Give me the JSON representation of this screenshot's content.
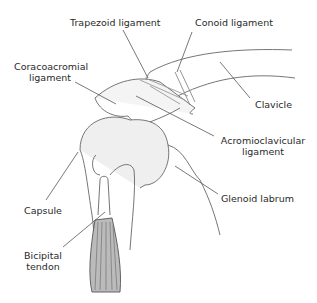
{
  "diagram": {
    "labels": {
      "trapezoid": "Trapezoid ligament",
      "conoid": "Conoid ligament",
      "coracoacromial_1": "Coracoacromial",
      "coracoacromial_2": "ligament",
      "clavicle": "Clavicle",
      "acromioclavicular_1": "Acromioclavicular",
      "acromioclavicular_2": "ligament",
      "capsule": "Capsule",
      "glenoid": "Glenoid labrum",
      "bicipital_1": "Bicipital",
      "bicipital_2": "tendon"
    },
    "colors": {
      "line": "#555555",
      "text": "#2a2a2a",
      "shade": "#9a9a9a"
    }
  }
}
